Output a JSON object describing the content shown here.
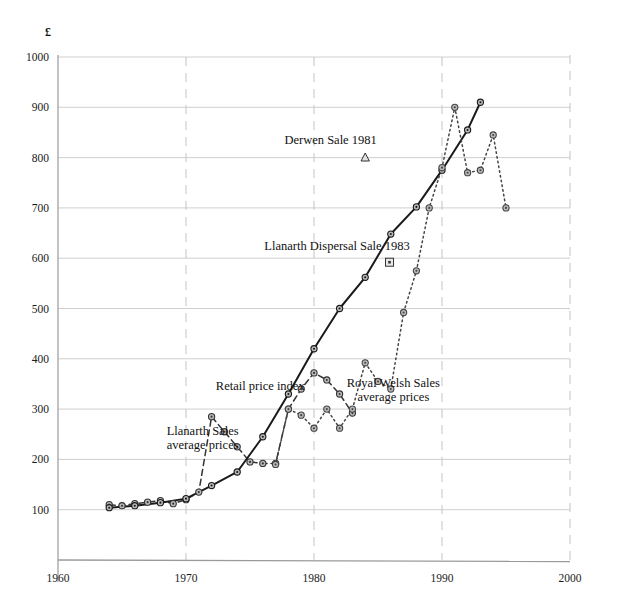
{
  "chart_data": {
    "type": "line",
    "title": "",
    "xlabel": "",
    "ylabel": "£",
    "currency_symbol": "£",
    "xlim": [
      1960,
      2000
    ],
    "ylim": [
      0,
      1000
    ],
    "xticks": [
      1960,
      1970,
      1980,
      1990,
      2000
    ],
    "yticks": [
      100,
      200,
      300,
      400,
      500,
      600,
      700,
      800,
      900,
      1000
    ],
    "grid": "horizontal-and-vertical-decades",
    "legend_position": "inline-annotations",
    "series": [
      {
        "name": "Llanarth Sales average prices",
        "style": "dashed",
        "color": "#333333",
        "marker": "circle-dot",
        "label_text": "Llanarth Sales\naverage prices",
        "label_x": 1971.3,
        "label_y": 248,
        "x": [
          1964,
          1965,
          1966,
          1967,
          1968,
          1969,
          1970,
          1971,
          1972,
          1973,
          1974,
          1975,
          1976,
          1977,
          1978,
          1979,
          1980,
          1981,
          1982,
          1983
        ],
        "y": [
          110,
          108,
          112,
          115,
          118,
          112,
          120,
          135,
          285,
          255,
          225,
          195,
          192,
          192,
          300,
          340,
          372,
          358,
          330,
          292
        ]
      },
      {
        "name": "Retail price index",
        "style": "solid",
        "color": "#1a1a1a",
        "marker": "circle-dot",
        "label_text": "Retail price index",
        "label_x": 1975.8,
        "label_y": 337,
        "x": [
          1964,
          1966,
          1968,
          1970,
          1972,
          1974,
          1976,
          1978,
          1980,
          1982,
          1984,
          1986,
          1988,
          1990,
          1992,
          1993
        ],
        "y": [
          104,
          108,
          114,
          122,
          148,
          175,
          245,
          330,
          420,
          500,
          562,
          648,
          702,
          775,
          855,
          910
        ]
      },
      {
        "name": "Royal Welsh Sales average prices",
        "style": "dotted",
        "color": "#444444",
        "marker": "circle-dot",
        "label_text": "Royal Welsh Sales\naverage prices",
        "label_x": 1986.2,
        "label_y": 343,
        "x": [
          1977,
          1978,
          1979,
          1980,
          1981,
          1982,
          1983,
          1984,
          1985,
          1986,
          1987,
          1988,
          1989,
          1990,
          1991,
          1992,
          1993,
          1994,
          1995
        ],
        "y": [
          190,
          300,
          288,
          262,
          300,
          262,
          300,
          392,
          355,
          340,
          492,
          575,
          700,
          780,
          900,
          770,
          775,
          845,
          700
        ]
      }
    ],
    "annotations": [
      {
        "id": "derwen-sale",
        "text": "Derwen Sale 1981",
        "text_x": 1981.3,
        "text_y": 827,
        "marker": "triangle",
        "marker_x": 1984.0,
        "marker_y": 800
      },
      {
        "id": "llanarth-dispersal-sale",
        "text": "Llanarth Dispersal Sale 1983",
        "text_x": 1981.8,
        "text_y": 617,
        "marker": "square",
        "marker_x": 1985.9,
        "marker_y": 592
      }
    ]
  },
  "colors": {
    "background": "#ffffff",
    "grid": "#c9c9c9",
    "axis": "#9a9a9a",
    "text": "#111111",
    "series_rpi": "#1a1a1a",
    "series_llanarth": "#333333",
    "series_royal_welsh": "#444444"
  }
}
